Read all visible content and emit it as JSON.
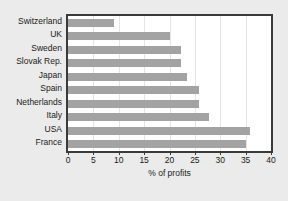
{
  "chart_data": {
    "type": "bar",
    "orientation": "horizontal",
    "title": "",
    "xlabel": "% of profits",
    "ylabel": "",
    "xlim": [
      0,
      40
    ],
    "xticks": [
      0,
      5,
      10,
      15,
      20,
      25,
      30,
      35,
      40
    ],
    "grid": true,
    "grid_axis": "x",
    "legend": false,
    "bar_color": "#a3a3a3",
    "plot_background": "#ffffff",
    "figure_background": "#ebebeb",
    "border_color": "#3a3a3a",
    "categories": [
      "Switzerland",
      "UK",
      "Sweden",
      "Slovak Rep.",
      "Japan",
      "Spain",
      "Netherlands",
      "Italy",
      "USA",
      "France"
    ],
    "values": [
      9.0,
      20.0,
      22.2,
      22.2,
      23.5,
      25.9,
      25.9,
      27.8,
      35.9,
      35.1
    ]
  },
  "xticklabels": [
    "0",
    "5",
    "10",
    "15",
    "20",
    "25",
    "30",
    "35",
    "40"
  ]
}
